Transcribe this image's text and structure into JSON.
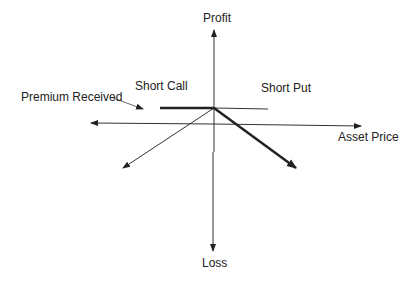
{
  "diagram": {
    "type": "option-payoff",
    "labels": {
      "y_axis_top": "Profit",
      "y_axis_bottom": "Loss",
      "x_axis": "Asset Price",
      "short_call": "Short Call",
      "short_put": "Short Put",
      "premium": "Premium Received"
    },
    "colors": {
      "line": "#222222",
      "background": "#ffffff"
    }
  }
}
